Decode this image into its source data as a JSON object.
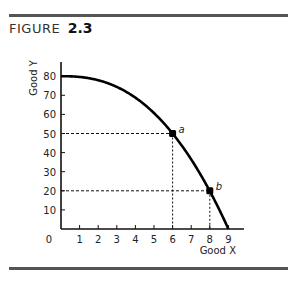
{
  "figure": {
    "label": "FIGURE",
    "number": "2.3"
  },
  "chart_data": {
    "type": "line",
    "title": "",
    "xlabel": "Good X",
    "ylabel": "Good Y",
    "xlim": [
      0,
      9
    ],
    "ylim": [
      0,
      80
    ],
    "grid": false,
    "origin_label": "0",
    "x_ticks": [
      1,
      2,
      3,
      4,
      5,
      6,
      7,
      8,
      9
    ],
    "x_tick_labels": [
      "1",
      "2",
      "3",
      "4",
      "5",
      "6",
      "7",
      "8",
      "9"
    ],
    "y_ticks": [
      10,
      20,
      30,
      40,
      50,
      60,
      70,
      80
    ],
    "y_tick_labels": [
      "10",
      "20",
      "30",
      "40",
      "50",
      "60",
      "70",
      "80"
    ],
    "series": [
      {
        "name": "production possibility frontier",
        "x": [
          0,
          1,
          2,
          3,
          4,
          5,
          6,
          7,
          8,
          9
        ],
        "y": [
          80,
          79.5,
          77.4,
          73.1,
          66.9,
          59.9,
          50,
          37.6,
          20,
          0
        ]
      }
    ],
    "points": [
      {
        "label": "a",
        "x": 6,
        "y": 50
      },
      {
        "label": "b",
        "x": 8,
        "y": 20
      }
    ],
    "guides": "dashed lines from each labeled point to both axes"
  }
}
